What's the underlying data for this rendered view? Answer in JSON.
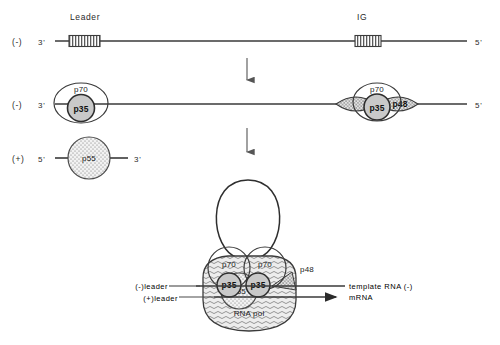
{
  "figure": {
    "background_color": "#ffffff",
    "ink_color": "#2a2a2a"
  },
  "rows": {
    "row1": {
      "name": "negative-strand-template",
      "polarity": "(-)",
      "left_terminus": "3'",
      "right_terminus": "5'",
      "features": [
        {
          "label": "Leader",
          "type": "hatched-box"
        },
        {
          "label": "IG",
          "type": "hatched-box"
        }
      ]
    },
    "row2": {
      "name": "negative-strand-with-bound-proteins",
      "polarity": "(-)",
      "left_terminus": "3'",
      "right_terminus": "5'",
      "complex_left": {
        "outer": "p70",
        "inner": "p35"
      },
      "complex_right": {
        "outer": "p70",
        "inner": "p35",
        "wing_left": "",
        "wing_right": "p48"
      }
    },
    "row3": {
      "name": "positive-strand-leader",
      "polarity": "(+)",
      "left_terminus": "5'",
      "right_terminus": "3'",
      "particle": "p55"
    },
    "row4": {
      "name": "transcription-complex",
      "loop_label": "",
      "subunits": [
        {
          "outer": "p70",
          "inner": "p35"
        },
        {
          "outer": "p70",
          "inner": "p35"
        }
      ],
      "p48_label": "p48",
      "p55_label": "p55",
      "body_label": "RNA  pol",
      "left_labels": [
        "(-)leader",
        "(+)leader"
      ],
      "right_labels": [
        "template  RNA  (-)",
        "mRNA"
      ]
    }
  },
  "arrows": {
    "step1": "down-arrow",
    "step2": "down-arrow"
  }
}
